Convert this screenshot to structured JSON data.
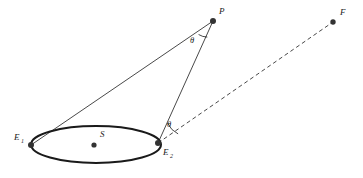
{
  "figure": {
    "background_color": "#ffffff",
    "stroke_color": "#1a1a1a",
    "width": 363,
    "height": 178
  },
  "labels": {
    "point_p": "P",
    "point_f": "F",
    "point_s": "S",
    "point_e1_base": "E",
    "point_e1_sub": "1",
    "point_e2_base": "E",
    "point_e2_sub": "2",
    "theta_at_p": "θ",
    "theta_at_e2": "θ"
  },
  "geometry": {
    "ellipse": {
      "cx": 96,
      "cy": 144.5,
      "rx": 65,
      "ry": 18.5,
      "stroke_width": 2.0,
      "stroke": "#1a1a1a",
      "fill": "none"
    },
    "points": [
      {
        "name": "P",
        "x": 213,
        "y": 21,
        "r": 3.0,
        "color": "#333333"
      },
      {
        "name": "F",
        "x": 333,
        "y": 22,
        "r": 2.7,
        "color": "#333333"
      },
      {
        "name": "E1",
        "x": 31,
        "y": 145,
        "r": 3.0,
        "color": "#333333"
      },
      {
        "name": "E2",
        "x": 158,
        "y": 143,
        "r": 3.0,
        "color": "#333333"
      },
      {
        "name": "S",
        "x": 94,
        "y": 145,
        "r": 2.6,
        "color": "#333333"
      }
    ],
    "segments": [
      {
        "name": "E1-to-P",
        "x1": 31,
        "y1": 145,
        "x2": 213,
        "y2": 21,
        "style": "solid",
        "width": 0.8
      },
      {
        "name": "E2-to-P",
        "x1": 158,
        "y1": 143,
        "x2": 213,
        "y2": 21,
        "style": "solid",
        "width": 0.8
      },
      {
        "name": "E2-to-F",
        "x1": 158,
        "y1": 143,
        "x2": 333,
        "y2": 22,
        "style": "dashed",
        "width": 0.8,
        "dash": "4 3"
      }
    ],
    "angle_arcs": [
      {
        "name": "arc-at-p",
        "cx": 213,
        "cy": 21,
        "r": 17
      },
      {
        "name": "arc-at-e2",
        "cx": 158,
        "cy": 143,
        "r": 22
      }
    ]
  },
  "label_positions": {
    "p": {
      "x": 219,
      "y": 14
    },
    "f": {
      "x": 340,
      "y": 15
    },
    "s": {
      "x": 100,
      "y": 137
    },
    "e1": {
      "x": 15,
      "y": 140
    },
    "e1_sub": {
      "x": 22,
      "y": 142
    },
    "e2": {
      "x": 163,
      "y": 155
    },
    "e2_sub": {
      "x": 170,
      "y": 157
    },
    "theta_p": {
      "x": 190,
      "y": 43
    },
    "theta_e2": {
      "x": 167,
      "y": 126
    }
  }
}
